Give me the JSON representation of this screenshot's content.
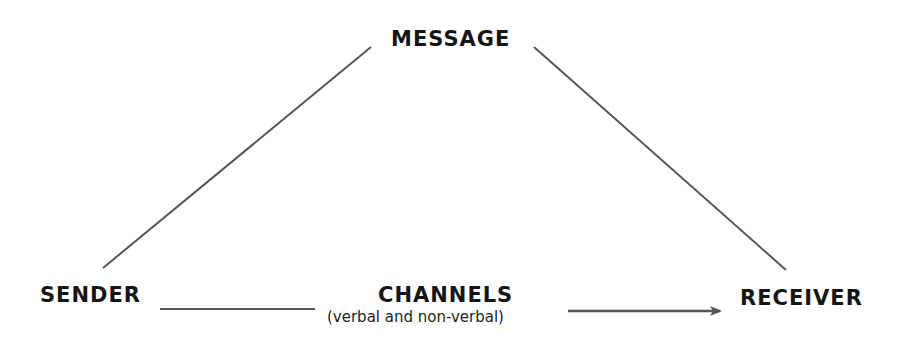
{
  "diagram": {
    "type": "communication-model-triangle",
    "nodes": {
      "message": "MESSAGE",
      "sender": "SENDER",
      "receiver": "RECEIVER",
      "channels": "CHANNELS",
      "channels_subtitle": "(verbal and non-verbal)"
    },
    "edges": [
      {
        "from": "sender",
        "to": "message",
        "style": "line"
      },
      {
        "from": "message",
        "to": "receiver",
        "style": "line"
      },
      {
        "from": "sender",
        "to": "receiver",
        "via": "channels",
        "style": "arrow"
      }
    ],
    "colors": {
      "line": "#555555",
      "text": "#151515",
      "background": "#ffffff"
    }
  }
}
